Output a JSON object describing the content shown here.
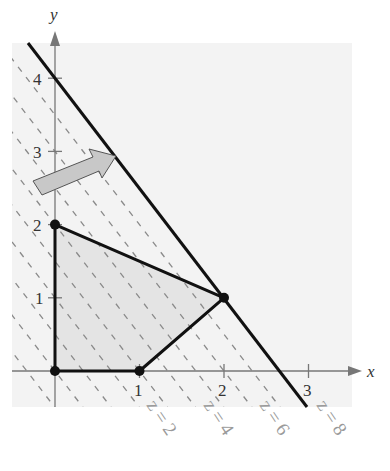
{
  "figure": {
    "axes": {
      "x_label": "x",
      "y_label": "y",
      "x_ticks": [
        {
          "value": 1,
          "label": "1"
        },
        {
          "value": 2,
          "label": "2"
        },
        {
          "value": 3,
          "label": "3"
        }
      ],
      "y_ticks": [
        {
          "value": 1,
          "label": "1"
        },
        {
          "value": 2,
          "label": "2"
        },
        {
          "value": 3,
          "label": "3"
        },
        {
          "value": 4,
          "label": "4"
        }
      ]
    },
    "feasible_region": {
      "vertices": [
        [
          0,
          0
        ],
        [
          1,
          0
        ],
        [
          2,
          1
        ],
        [
          0,
          2
        ]
      ],
      "fill": "#e6e6e6"
    },
    "objective_lines": {
      "equation": "z = 3x + 2y",
      "solid_line": {
        "z": 8
      },
      "dashed_z_values": [
        -1,
        0,
        1,
        2,
        3,
        4,
        5,
        6,
        7
      ],
      "labels": [
        {
          "z": 2,
          "text": "z = 2"
        },
        {
          "z": 4,
          "text": "z = 4"
        },
        {
          "z": 6,
          "text": "z = 6"
        },
        {
          "z": 8,
          "text": "z = 8"
        }
      ]
    },
    "arrow": {
      "description": "direction of increasing z",
      "color": "#c8c8c8"
    },
    "colors": {
      "background_panel": "#f3f3f3",
      "line": "#111111",
      "dashed": "#8a8a8a",
      "axis": "#777777"
    }
  }
}
